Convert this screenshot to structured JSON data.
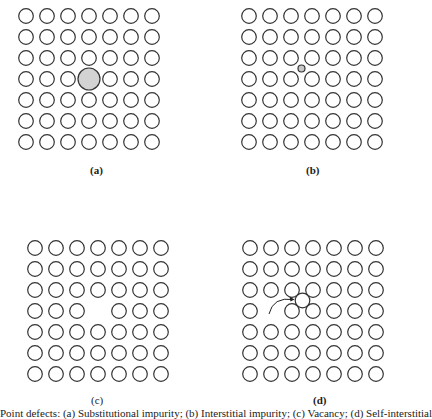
{
  "figure": {
    "lattice": {
      "rows": 7,
      "cols": 7,
      "spacing": 21,
      "radius": 7.3,
      "stroke": "#333333",
      "fill": "#ffffff"
    },
    "panels": [
      {
        "id": "a",
        "label": "(a)",
        "x": 26,
        "y": 16,
        "label_x": 90,
        "label_y": 164,
        "defect": "substitutional",
        "defect_row": 3,
        "defect_col": 3,
        "defect_radius": 11,
        "defect_fill": "#d3d3d3"
      },
      {
        "id": "b",
        "label": "(b)",
        "x": 249,
        "y": 16,
        "label_x": 306,
        "label_y": 164,
        "defect": "interstitial",
        "defect_row": 2.5,
        "defect_col": 2.5,
        "defect_radius": 3.5,
        "defect_fill": "#c8c8c8"
      },
      {
        "id": "c",
        "label": "(c)",
        "x": 35,
        "y": 248,
        "label_x": 91,
        "label_y": 394,
        "defect": "vacancy",
        "defect_row": 3,
        "defect_col": 3
      },
      {
        "id": "d",
        "label": "(d)",
        "x": 250,
        "y": 248,
        "label_x": 313,
        "label_y": 394,
        "defect": "interstitialcy",
        "vacancy_row": 3,
        "vacancy_col": 1,
        "moved_row": 2.5,
        "moved_col": 2.5,
        "arrow": true
      }
    ]
  },
  "caption": "Point defects: (a) Substitutional impurity; (b) Interstitial impurity; (c) Vacancy; (d) Self-interstitial"
}
